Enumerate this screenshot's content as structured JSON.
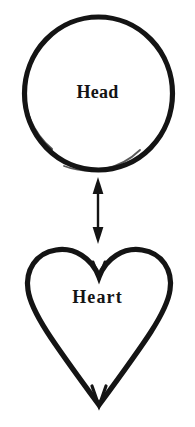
{
  "diagram": {
    "type": "two-node-bidirectional-relationship",
    "background_color": "#ffffff",
    "stroke_color": "#141414",
    "nodes": [
      {
        "id": "head",
        "label": "Head",
        "shape": "circle",
        "shape_icon_name": "circle-outline-icon",
        "center_x": 98,
        "center_y": 93,
        "radius": 75,
        "stroke_width": 5,
        "fill": "none"
      },
      {
        "id": "heart",
        "label": "Heart",
        "shape": "heart",
        "shape_icon_name": "heart-outline-icon",
        "center_x": 99,
        "top_y": 250,
        "bottom_y": 406,
        "width": 142,
        "stroke_width": 5,
        "fill": "none"
      }
    ],
    "connector": {
      "id": "head-heart-connector",
      "style": "double-headed-arrow",
      "orientation": "vertical",
      "x": 98,
      "from_y": 178,
      "to_y": 243,
      "shaft_width": 2,
      "arrowhead_width": 11,
      "arrowhead_height": 15,
      "arrowheads": "both"
    }
  }
}
